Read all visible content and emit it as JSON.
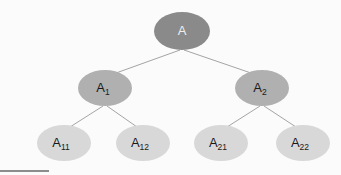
{
  "diagram": {
    "background_color": "#fbfbfb",
    "edge_color": "#9a9a9a",
    "footer_rule_color": "#8d8d8d",
    "levels": [
      {
        "name": "root",
        "fill": "#8a8a8a",
        "text_color": "#eeeeee"
      },
      {
        "name": "branch",
        "fill": "#b0b0b0",
        "text_color": "#1a1a1a"
      },
      {
        "name": "leaf",
        "fill": "#d8d8d8",
        "text_color": "#1a1a1a"
      }
    ],
    "nodes": [
      {
        "id": "A",
        "base": "A",
        "sub": "",
        "level": 0,
        "cx": 182,
        "cy": 31,
        "rx": 28,
        "ry": 19,
        "fill": "#8a8a8a",
        "text_color": "#eeeeee"
      },
      {
        "id": "A1",
        "base": "A",
        "sub": "1",
        "level": 1,
        "cx": 105,
        "cy": 88,
        "rx": 27,
        "ry": 18,
        "fill": "#b0b0b0",
        "text_color": "#1a1a1a"
      },
      {
        "id": "A2",
        "base": "A",
        "sub": "2",
        "level": 1,
        "cx": 262,
        "cy": 88,
        "rx": 27,
        "ry": 18,
        "fill": "#b0b0b0",
        "text_color": "#1a1a1a"
      },
      {
        "id": "A11",
        "base": "A",
        "sub": "11",
        "level": 2,
        "cx": 64,
        "cy": 143,
        "rx": 27,
        "ry": 18,
        "fill": "#d8d8d8",
        "text_color": "#1a1a1a"
      },
      {
        "id": "A12",
        "base": "A",
        "sub": "12",
        "level": 2,
        "cx": 143,
        "cy": 143,
        "rx": 27,
        "ry": 18,
        "fill": "#d8d8d8",
        "text_color": "#1a1a1a"
      },
      {
        "id": "A21",
        "base": "A",
        "sub": "21",
        "level": 2,
        "cx": 221,
        "cy": 143,
        "rx": 27,
        "ry": 18,
        "fill": "#d8d8d8",
        "text_color": "#1a1a1a"
      },
      {
        "id": "A22",
        "base": "A",
        "sub": "22",
        "level": 2,
        "cx": 303,
        "cy": 143,
        "rx": 27,
        "ry": 18,
        "fill": "#d8d8d8",
        "text_color": "#1a1a1a"
      }
    ],
    "edges": [
      {
        "id": "A-A1",
        "from": "A",
        "to": "A1",
        "x1": 180,
        "y1": 50,
        "x2": 116,
        "y2": 73
      },
      {
        "id": "A-A2",
        "from": "A",
        "to": "A2",
        "x1": 184,
        "y1": 50,
        "x2": 251,
        "y2": 73
      },
      {
        "id": "A1-A11",
        "from": "A1",
        "to": "A11",
        "x1": 103,
        "y1": 106,
        "x2": 70,
        "y2": 127
      },
      {
        "id": "A1-A12",
        "from": "A1",
        "to": "A12",
        "x1": 107,
        "y1": 106,
        "x2": 137,
        "y2": 127
      },
      {
        "id": "A2-A21",
        "from": "A2",
        "to": "A21",
        "x1": 260,
        "y1": 106,
        "x2": 227,
        "y2": 127
      },
      {
        "id": "A2-A22",
        "from": "A2",
        "to": "A22",
        "x1": 264,
        "y1": 106,
        "x2": 296,
        "y2": 127
      }
    ]
  }
}
